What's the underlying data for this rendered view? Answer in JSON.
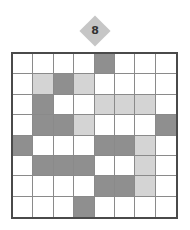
{
  "badge": {
    "label": "8",
    "color": "#c6c6c6"
  },
  "grid": {
    "rows": 8,
    "cols": 8,
    "legend": {
      "D": "dark-gray",
      "L": "light-gray",
      "W": "white"
    },
    "colors": {
      "D": "#8f8f8f",
      "L": "#d4d4d4",
      "W": "#ffffff"
    },
    "cells": [
      [
        "W",
        "W",
        "W",
        "W",
        "D",
        "W",
        "W",
        "W"
      ],
      [
        "W",
        "L",
        "D",
        "L",
        "W",
        "W",
        "W",
        "W"
      ],
      [
        "W",
        "D",
        "W",
        "W",
        "L",
        "L",
        "L",
        "W"
      ],
      [
        "W",
        "D",
        "D",
        "L",
        "W",
        "W",
        "W",
        "D"
      ],
      [
        "D",
        "W",
        "W",
        "W",
        "D",
        "D",
        "L",
        "W"
      ],
      [
        "W",
        "D",
        "D",
        "D",
        "W",
        "W",
        "L",
        "W"
      ],
      [
        "W",
        "W",
        "W",
        "W",
        "D",
        "D",
        "L",
        "W"
      ],
      [
        "W",
        "W",
        "W",
        "D",
        "W",
        "W",
        "W",
        "W"
      ]
    ]
  }
}
